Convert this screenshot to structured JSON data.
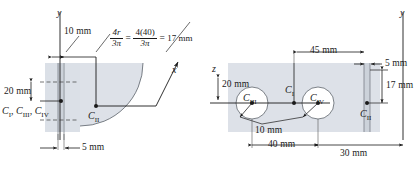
{
  "figure": {
    "colors": {
      "line": "#1a1a1a",
      "shape_fill": "#dfe3e9",
      "shape_fill_alt": "#d6dbe3",
      "hole_fill": "#ffffff",
      "dim_line": "#2a2a2a"
    }
  },
  "left_view": {
    "name": "front-view",
    "axis_y": "y",
    "axis_x": "x",
    "formula": {
      "numerator_1": "4r",
      "denominator_1": "3π",
      "equals_1": "=",
      "numerator_2": "4(40)",
      "denominator_2": "3π",
      "equals_2": "=",
      "result": "17 mm"
    },
    "dimensions": [
      {
        "label": "10 mm",
        "name": "dim-10mm-top"
      },
      {
        "label": "20 mm",
        "name": "dim-20mm-left"
      },
      {
        "label": "5 mm",
        "name": "dim-5mm-bottom"
      }
    ],
    "centroids": [
      {
        "label": "C",
        "sub": "II",
        "name": "centroid-c2"
      },
      {
        "label": "C",
        "sub": "I",
        "name": "centroid-c1"
      },
      {
        "label": "C",
        "sub": "III",
        "name": "centroid-c3"
      },
      {
        "label": "C",
        "sub": "IV",
        "name": "centroid-c4"
      }
    ],
    "centroid_group_text": "C₁, C₃, C₄"
  },
  "right_view": {
    "name": "top-view",
    "axis_z": "z",
    "axis_y": "y",
    "dimensions": [
      {
        "label": "20 mm",
        "name": "dim-20mm-left-right-view"
      },
      {
        "label": "45 mm",
        "name": "dim-45mm"
      },
      {
        "label": "5 mm",
        "name": "dim-5mm-right"
      },
      {
        "label": "17 mm",
        "name": "dim-17mm"
      },
      {
        "label": "10 mm",
        "name": "dim-10mm-radius"
      },
      {
        "label": "40 mm",
        "name": "dim-40mm"
      },
      {
        "label": "30 mm",
        "name": "dim-30mm"
      }
    ],
    "centroids": [
      {
        "label": "C",
        "sub": "III",
        "name": "centroid-c3-right"
      },
      {
        "label": "C",
        "sub": "I",
        "name": "centroid-c1-right"
      },
      {
        "label": "C",
        "sub": "IV",
        "name": "centroid-c4-right"
      },
      {
        "label": "C",
        "sub": "II",
        "name": "centroid-c2-right"
      }
    ]
  }
}
